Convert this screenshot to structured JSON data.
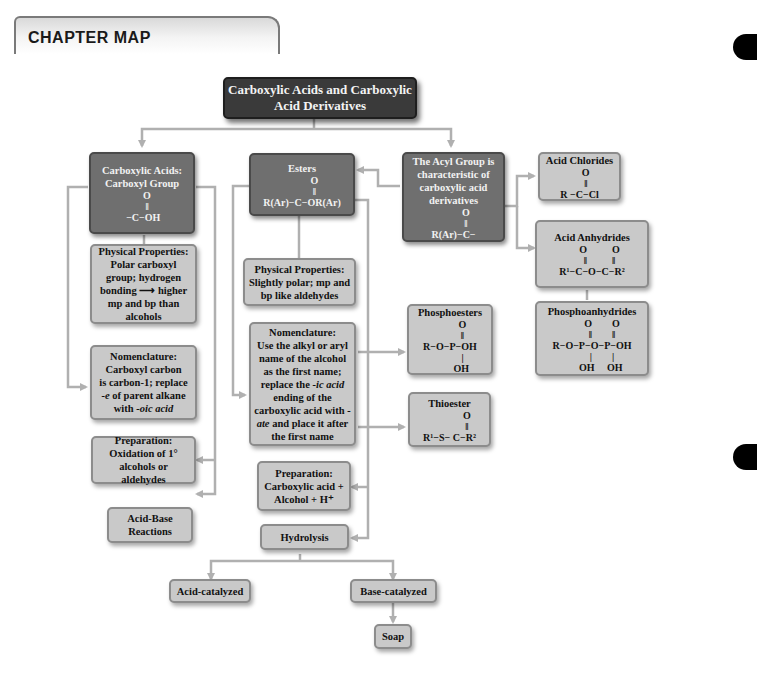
{
  "header": {
    "title": "CHAPTER MAP"
  },
  "nodes": {
    "root": {
      "label": "Carboxylic Acids and Carboxylic Acid Derivatives"
    },
    "carboxylic_acids": {
      "line1": "Carboxylic Acids:",
      "line2": "Carboxyl Group",
      "formula": "    O\n    ‖\n −C−OH"
    },
    "esters": {
      "label": "Esters",
      "formula": "          O\n          ‖\nR(Ar)−C−OR(Ar)"
    },
    "acyl_group": {
      "label": "The Acyl Group is characteristic of carboxylic acid derivatives",
      "formula": "          O\n          ‖\nR(Ar)−C−"
    },
    "acid_chlorides": {
      "label": "Acid Chlorides",
      "formula": "     O\n     ‖\nR −C−Cl"
    },
    "acid_anhydrides": {
      "label": "Acid Anhydrides",
      "formula": "      O          O\n      ‖          ‖\nR¹−C−O−C−R²"
    },
    "phosphoanhydrides": {
      "label": "Phosphoanhydrides",
      "formula": "        O        O\n        ‖        ‖\nR−O−P−O−P−OH\n        |        |\n       OH     OH"
    },
    "acid_phys_props": {
      "label": "Physical Properties: Polar carboxyl group; hydrogen bonding ⟶ higher mp and bp than alcohols"
    },
    "ester_phys_props": {
      "label": "Physical Properties: Slightly polar; mp and bp like aldehydes"
    },
    "acid_nomenclature": {
      "line1": "Nomenclature:",
      "line2": "Carboxyl carbon",
      "line3": "is carbon-1; replace",
      "italic1": "-e",
      "line4": " of parent alkane",
      "line5": "with ",
      "italic2": "-oic acid"
    },
    "ester_nomenclature": {
      "line1": "Nomenclature:",
      "line2": "Use the alkyl or aryl name of the alcohol as the first name; replace the ",
      "italic1": "-ic acid",
      "line3": " ending of the carboxylic acid with ",
      "italic2": "-ate",
      "line4": " and place it after the first name"
    },
    "phosphoesters": {
      "label": "Phosphoesters",
      "formula": "          O\n          ‖\nR−O−P−OH\n          |\n         OH"
    },
    "thioester": {
      "label": "Thioester",
      "formula": "              O\n              ‖\nR¹−S− C−R²"
    },
    "acid_preparation": {
      "label": "Preparation: Oxidation of 1° alcohols or aldehydes"
    },
    "ester_preparation": {
      "label": "Preparation: Carboxylic acid + Alcohol + H⁺"
    },
    "acid_base": {
      "label": "Acid-Base Reactions"
    },
    "hydrolysis": {
      "label": "Hydrolysis"
    },
    "acid_catalyzed": {
      "label": "Acid-catalyzed"
    },
    "base_catalyzed": {
      "label": "Base-catalyzed"
    },
    "soap": {
      "label": "Soap"
    }
  },
  "colors": {
    "dark_node": "#6f6f6f",
    "light_node": "#c9c9c9",
    "title_node": "#3a3a3a",
    "connector": "#b0b0b0"
  }
}
